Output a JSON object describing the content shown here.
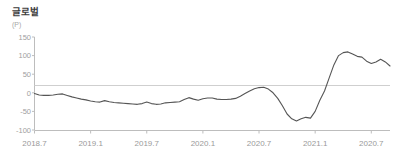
{
  "chart_title": "글로벌",
  "unit_label": "(P)",
  "colors": {
    "line": "#555555",
    "axis": "#bdbdbd",
    "zero_line": "#cfcfcf",
    "tick_text": "#a0a0a0",
    "title_text": "#3c3c3c",
    "background": "#ffffff"
  },
  "chart_data": {
    "type": "line",
    "title": "글로벌",
    "xlabel": "",
    "ylabel": "(P)",
    "ylim": [
      -100,
      150
    ],
    "y_ticks": [
      150,
      100,
      50,
      0,
      -50,
      -100
    ],
    "y_tick_labels": [
      "150",
      "100",
      "50",
      "0",
      "-50",
      "-100"
    ],
    "grid": false,
    "zero_line": 0,
    "legend": "none",
    "x_tick_labels": [
      "2018.7",
      "2019.1",
      "2019.7",
      "2020.1",
      "2020.7",
      "2021.1",
      "2020.7"
    ],
    "x_tick_positions": [
      0,
      6,
      12,
      18,
      24,
      30,
      36
    ],
    "xlim": [
      0,
      38
    ],
    "series": [
      {
        "name": "글로벌",
        "x": [
          0,
          0.5,
          1,
          1.5,
          2,
          2.5,
          3,
          3.5,
          4,
          4.5,
          5,
          5.5,
          6,
          6.5,
          7,
          7.5,
          8,
          8.5,
          9,
          9.5,
          10,
          10.5,
          11,
          11.5,
          12,
          12.5,
          13,
          13.5,
          14,
          14.5,
          15,
          15.5,
          16,
          16.5,
          17,
          17.5,
          18,
          18.5,
          19,
          19.5,
          20,
          20.5,
          21,
          21.5,
          22,
          22.5,
          23,
          23.5,
          24,
          24.5,
          25,
          25.5,
          26,
          26.5,
          27,
          27.5,
          28,
          28.5,
          29,
          29.5,
          30,
          30.5,
          31,
          31.5,
          32,
          32.5,
          33,
          33.5,
          34,
          34.5,
          35,
          35.5,
          36,
          36.5,
          37,
          37.5,
          38
        ],
        "values": [
          -2,
          -6,
          -7,
          -7,
          -6,
          -4,
          -3,
          -7,
          -11,
          -14,
          -17,
          -19,
          -22,
          -24,
          -25,
          -21,
          -24,
          -26,
          -27,
          -28,
          -29,
          -30,
          -31,
          -29,
          -25,
          -29,
          -31,
          -30,
          -27,
          -26,
          -25,
          -24,
          -18,
          -13,
          -17,
          -20,
          -16,
          -14,
          -14,
          -17,
          -18,
          -18,
          -17,
          -15,
          -9,
          -2,
          5,
          11,
          14,
          15,
          10,
          0,
          -15,
          -35,
          -57,
          -70,
          -76,
          -70,
          -66,
          -68,
          -50,
          -20,
          5,
          40,
          75,
          100,
          108,
          110,
          104,
          98,
          96,
          85,
          79,
          83,
          90,
          83,
          72
        ]
      }
    ]
  }
}
